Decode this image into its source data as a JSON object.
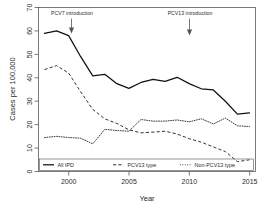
{
  "chart_data": {
    "type": "line",
    "title": "",
    "xlabel": "Year",
    "ylabel": "Cases per 100,000",
    "xlim": [
      1997.5,
      2015.5
    ],
    "ylim": [
      0,
      70
    ],
    "xticks": [
      2000,
      2005,
      2010,
      2015
    ],
    "yticks": [
      0,
      10,
      20,
      30,
      40,
      50,
      60,
      70
    ],
    "grid": false,
    "legend_position": "bottom-left-inside",
    "x": [
      1998,
      1999,
      2000,
      2001,
      2002,
      2003,
      2004,
      2005,
      2006,
      2007,
      2008,
      2009,
      2010,
      2011,
      2012,
      2013,
      2014,
      2015
    ],
    "series": [
      {
        "name": "All IPD",
        "style": "solid",
        "values": [
          59.0,
          60.0,
          58.0,
          49.0,
          40.8,
          41.5,
          37.5,
          35.5,
          38.0,
          39.3,
          38.5,
          40.2,
          37.5,
          35.3,
          34.8,
          30.0,
          24.5,
          25.0
        ]
      },
      {
        "name": "PCV13 type",
        "style": "dashed",
        "values": [
          43.5,
          45.2,
          42.0,
          34.0,
          26.5,
          22.5,
          20.5,
          17.8,
          16.5,
          16.8,
          17.2,
          16.0,
          14.0,
          12.5,
          10.5,
          8.5,
          4.2,
          5.0
        ]
      },
      {
        "name": "Non-PCV13 type",
        "style": "dotted",
        "values": [
          14.5,
          15.0,
          14.5,
          14.2,
          11.8,
          18.0,
          17.5,
          17.2,
          22.2,
          21.5,
          21.5,
          22.0,
          21.2,
          22.5,
          20.3,
          22.8,
          19.5,
          19.2
        ]
      }
    ],
    "annotations": [
      {
        "id": "pcv7",
        "label": "PCV7 introduction",
        "x": 2000,
        "arrow": "down"
      },
      {
        "id": "pcv13",
        "label": "PCV13 introduction",
        "x": 2010,
        "arrow": "down"
      }
    ]
  },
  "colors": {
    "all_ipd": "#111111",
    "pcv13_type": "#333333",
    "non_pcv13_type": "#3a3a3a",
    "axis": "#5a5a5a",
    "background": "#ffffff"
  }
}
